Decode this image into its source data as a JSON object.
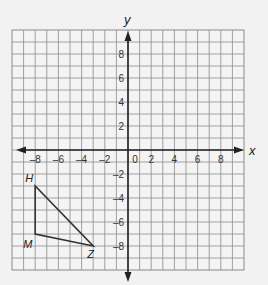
{
  "chart_data": {
    "type": "scatter",
    "title": "",
    "xlabel": "x",
    "ylabel": "y",
    "xlim": [
      -10,
      10
    ],
    "ylim": [
      -10,
      10
    ],
    "grid": true,
    "x_ticks": [
      -8,
      -6,
      -4,
      -2,
      0,
      2,
      4,
      6,
      8
    ],
    "y_ticks": [
      8,
      6,
      4,
      2,
      -2,
      -4,
      -6,
      -8
    ],
    "x_tick_labels": [
      "–8",
      "–6",
      "–4",
      "–2",
      "0",
      "2",
      "4",
      "6",
      "8"
    ],
    "y_tick_labels": [
      "8",
      "6",
      "4",
      "2",
      "–2",
      "–4",
      "–6",
      "–8"
    ],
    "polygon": {
      "name": "triangle HMZ",
      "vertices": [
        {
          "label": "H",
          "x": -8,
          "y": -3
        },
        {
          "label": "M",
          "x": -8,
          "y": -7
        },
        {
          "label": "Z",
          "x": -3,
          "y": -8
        }
      ]
    },
    "colors": {
      "background": "#f2f2f2",
      "grid": "#8a8a8a",
      "axis": "#222222",
      "shape": "#333333"
    }
  }
}
